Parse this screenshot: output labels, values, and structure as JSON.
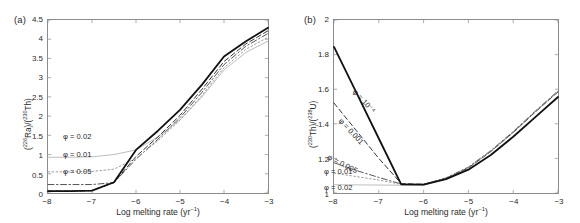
{
  "figure": {
    "width": 580,
    "height": 223,
    "background": "#ffffff"
  },
  "panels": [
    {
      "tag": "(a)",
      "xlabel_main": "Log melting rate (yr",
      "xlabel_sup": "−1",
      "xlabel_close": ")",
      "ylabel_parts": [
        "(",
        "226",
        "Ra)/(",
        "230",
        "Th)"
      ],
      "ylabel_plain": "(226Ra)/(230Th)"
    },
    {
      "tag": "(b)",
      "xlabel_main": "Log melting rate (yr",
      "xlabel_sup": "−1",
      "xlabel_close": ")",
      "ylabel_parts": [
        "(",
        "230",
        "Th)/(",
        "238",
        "U)"
      ],
      "ylabel_plain": "(230Th)/(238U)"
    }
  ],
  "labels_a": [
    {
      "text": "φ = 0.02"
    },
    {
      "text": "φ = 0.01"
    },
    {
      "text": "φ = 0.05"
    }
  ],
  "labels_b": [
    {
      "text": "φ = 10⁻⁴"
    },
    {
      "text": "φ = 0.001"
    },
    {
      "text": "φ = 0.005"
    },
    {
      "text": "φ = 0.01"
    },
    {
      "text": "φ = 0.02"
    }
  ],
  "colors": {
    "axis": "#8c8c8c",
    "tick_text": "#2b2b2b",
    "solid_black": "#111111",
    "dashed_dark": "#333333",
    "dash_dot": "#555555",
    "light_gray": "#b5b5b5",
    "mid_gray": "#9a9a9a"
  },
  "chart_data": [
    {
      "type": "line",
      "panel": "(a)",
      "title": "",
      "xlabel": "Log melting rate (yr−1)",
      "ylabel": "(226Ra)/(230Th)",
      "xlim": [
        -8,
        -3
      ],
      "ylim": [
        0,
        4.5
      ],
      "xticks": [
        -8,
        -7,
        -6,
        -5,
        -4,
        -3
      ],
      "xticklabels": [
        "−8",
        "−7",
        "−6",
        "−5",
        "−4",
        "−3"
      ],
      "yticks": [
        0,
        0.5,
        1,
        1.5,
        2,
        2.5,
        3,
        3.5,
        4,
        4.5
      ],
      "yticklabels": [
        "0",
        "0.5",
        "1",
        "1.5",
        "2",
        "2.5",
        "3",
        "3.5",
        "4",
        "4.5"
      ],
      "grid": false,
      "legend": "inline-annotations",
      "x": [
        -8.0,
        -7.5,
        -7.0,
        -6.5,
        -6.0,
        -5.5,
        -5.0,
        -4.5,
        -4.0,
        -3.5,
        -3.0
      ],
      "series": [
        {
          "name": "φ = 10⁻⁴",
          "style": "solid",
          "color": "#111111",
          "width": 1.8,
          "values": [
            0.05,
            0.05,
            0.06,
            0.28,
            1.12,
            1.62,
            2.16,
            2.82,
            3.55,
            3.95,
            4.3
          ]
        },
        {
          "name": "φ = 0.001",
          "style": "dashed",
          "color": "#333333",
          "width": 1.0,
          "values": [
            0.05,
            0.05,
            0.06,
            0.27,
            0.95,
            1.46,
            2.02,
            2.7,
            3.42,
            3.88,
            4.22
          ]
        },
        {
          "name": "φ = 0.005",
          "style": "dashdot",
          "color": "#555555",
          "width": 1.0,
          "values": [
            0.22,
            0.22,
            0.22,
            0.27,
            0.88,
            1.4,
            1.96,
            2.62,
            3.34,
            3.82,
            4.15
          ]
        },
        {
          "name": "φ = 0.01",
          "style": "dotted",
          "color": "#9a9a9a",
          "width": 1.0,
          "values": [
            0.55,
            0.55,
            0.56,
            0.62,
            0.9,
            1.36,
            1.9,
            2.54,
            3.26,
            3.74,
            4.05
          ]
        },
        {
          "name": "φ = 0.02",
          "style": "solid-thin",
          "color": "#b5b5b5",
          "width": 0.9,
          "values": [
            0.93,
            0.93,
            0.94,
            1.0,
            1.12,
            1.46,
            1.9,
            2.5,
            3.2,
            3.66,
            3.95
          ]
        }
      ]
    },
    {
      "type": "line",
      "panel": "(b)",
      "title": "",
      "xlabel": "Log melting rate (yr−1)",
      "ylabel": "(230Th)/(238U)",
      "xlim": [
        -8,
        -3
      ],
      "ylim": [
        1,
        2
      ],
      "xticks": [
        -8,
        -7,
        -6,
        -5,
        -4,
        -3
      ],
      "xticklabels": [
        "−8",
        "−7",
        "−6",
        "−5",
        "−4",
        "−3"
      ],
      "yticks": [
        1,
        1.2,
        1.4,
        1.6,
        1.8,
        2
      ],
      "yticklabels": [
        "1",
        "1.2",
        "1.4",
        "1.6",
        "1.8",
        "2"
      ],
      "grid": false,
      "legend": "inline-annotations",
      "x": [
        -8.0,
        -7.5,
        -7.0,
        -6.5,
        -6.0,
        -5.5,
        -5.0,
        -4.5,
        -4.0,
        -3.5,
        -3.0
      ],
      "series": [
        {
          "name": "φ = 10⁻⁴",
          "style": "solid",
          "color": "#111111",
          "width": 1.8,
          "values": [
            1.845,
            1.58,
            1.315,
            1.05,
            1.048,
            1.08,
            1.135,
            1.22,
            1.325,
            1.44,
            1.555
          ]
        },
        {
          "name": "φ = 0.001",
          "style": "dashed",
          "color": "#333333",
          "width": 1.0,
          "values": [
            1.52,
            1.36,
            1.2,
            1.055,
            1.05,
            1.085,
            1.145,
            1.24,
            1.35,
            1.47,
            1.585
          ]
        },
        {
          "name": "φ = 0.005",
          "style": "dashdot",
          "color": "#555555",
          "width": 1.0,
          "values": [
            1.175,
            1.13,
            1.09,
            1.052,
            1.05,
            1.087,
            1.15,
            1.245,
            1.355,
            1.475,
            1.59
          ]
        },
        {
          "name": "φ = 0.01",
          "style": "dotted",
          "color": "#9a9a9a",
          "width": 1.0,
          "values": [
            1.115,
            1.095,
            1.075,
            1.05,
            1.049,
            1.086,
            1.148,
            1.243,
            1.352,
            1.472,
            1.588
          ]
        },
        {
          "name": "φ = 0.02",
          "style": "solid-thin",
          "color": "#b5b5b5",
          "width": 0.9,
          "values": [
            1.048,
            1.047,
            1.046,
            1.045,
            1.045,
            1.082,
            1.145,
            1.24,
            1.35,
            1.47,
            1.585
          ]
        }
      ]
    }
  ]
}
